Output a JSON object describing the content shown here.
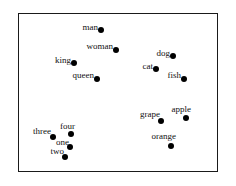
{
  "figure": {
    "type": "word-embedding-scatter",
    "background_color": "#ffffff",
    "frame_color": "#1a1a1a",
    "point_color": "#000000",
    "label_color": "#111111"
  },
  "chart_data": {
    "type": "scatter",
    "title": "",
    "subtitle": "",
    "xlabel": "",
    "ylabel": "",
    "grid": false,
    "legend": null,
    "axis_ticks": [],
    "axis_ranges": {
      "x": [
        18,
        218
      ],
      "y": [
        13,
        172
      ]
    },
    "point_diameter_px": 6,
    "label_font_size_px": 9,
    "label_anchor": "right-of-text-dot-follows",
    "groups": [
      {
        "name": "people",
        "points": [
          {
            "label": "man",
            "x": 101,
            "y": 30,
            "label_x": 98,
            "label_y": 27
          },
          {
            "label": "woman",
            "x": 116,
            "y": 50,
            "label_x": 113,
            "label_y": 46
          },
          {
            "label": "king",
            "x": 74,
            "y": 63,
            "label_x": 71,
            "label_y": 60
          },
          {
            "label": "queen",
            "x": 97,
            "y": 79,
            "label_x": 94,
            "label_y": 75
          }
        ]
      },
      {
        "name": "animals",
        "points": [
          {
            "label": "dog",
            "x": 173,
            "y": 56,
            "label_x": 170,
            "label_y": 53
          },
          {
            "label": "cat",
            "x": 156,
            "y": 69,
            "label_x": 153,
            "label_y": 66
          },
          {
            "label": "fish",
            "x": 184,
            "y": 79,
            "label_x": 181,
            "label_y": 75
          }
        ]
      },
      {
        "name": "fruits",
        "points": [
          {
            "label": "apple",
            "x": 186,
            "y": 118,
            "label_x": 191,
            "label_y": 109
          },
          {
            "label": "grape",
            "x": 161,
            "y": 121,
            "label_x": 160,
            "label_y": 114
          },
          {
            "label": "orange",
            "x": 171,
            "y": 146,
            "label_x": 176,
            "label_y": 136
          }
        ]
      },
      {
        "name": "numbers",
        "points": [
          {
            "label": "three",
            "x": 53,
            "y": 137,
            "label_x": 51,
            "label_y": 131
          },
          {
            "label": "four",
            "x": 71,
            "y": 134,
            "label_x": 75,
            "label_y": 126
          },
          {
            "label": "one",
            "x": 70,
            "y": 147,
            "label_x": 69,
            "label_y": 142
          },
          {
            "label": "two",
            "x": 65,
            "y": 157,
            "label_x": 64,
            "label_y": 151
          }
        ]
      }
    ]
  }
}
